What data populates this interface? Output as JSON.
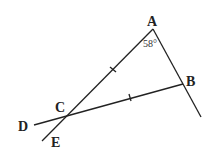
{
  "diagram": {
    "points": [
      {
        "name": "A",
        "x": 153,
        "y": 29
      },
      {
        "name": "B",
        "x": 183,
        "y": 84
      },
      {
        "name": "C",
        "x": 67,
        "y": 115
      },
      {
        "name": "D",
        "x": 34,
        "y": 125
      },
      {
        "name": "E",
        "x": 42,
        "y": 141
      }
    ],
    "labels": {
      "A": "A",
      "B": "B",
      "C": "C",
      "D": "D",
      "E": "E"
    },
    "angle_label": "58°",
    "segments": [
      "A-(201,117)",
      "A-E",
      "D-B"
    ],
    "congruent_ticks": [
      "AC",
      "CB"
    ]
  }
}
